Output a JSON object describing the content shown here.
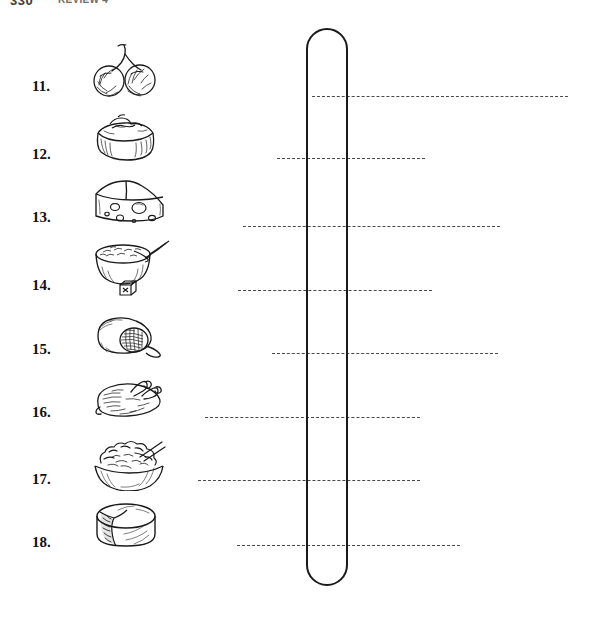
{
  "page": {
    "width": 591,
    "height": 619,
    "background": "#ffffff",
    "ink_color": "#1a1a1a",
    "line_color": "#4a4a4a"
  },
  "header": {
    "page_number": "330",
    "section_label": "REVIEW 4",
    "visible": "partially cut off at top edge"
  },
  "capsule": {
    "name": "answer-column-capsule",
    "shape": "vertical rounded rectangle outline",
    "x": 306,
    "y": 28,
    "width": 42,
    "height": 558,
    "stroke": "#1a1a1a"
  },
  "items": [
    {
      "number": "11.",
      "icon": "cherries-icon",
      "label": "cherries",
      "num_y": 85,
      "pic": {
        "x": 88,
        "y": 42,
        "w": 72,
        "h": 62
      },
      "line": {
        "x": 312,
        "y": 96,
        "width": 256
      }
    },
    {
      "number": "12.",
      "icon": "cake-slice-icon",
      "label": "layered cake",
      "num_y": 153,
      "pic": {
        "x": 90,
        "y": 113,
        "w": 70,
        "h": 52
      },
      "line": {
        "x": 277,
        "y": 158,
        "width": 148
      }
    },
    {
      "number": "13.",
      "icon": "swiss-cheese-wedge-icon",
      "label": "cheese wedge",
      "num_y": 216,
      "pic": {
        "x": 90,
        "y": 178,
        "w": 78,
        "h": 52
      },
      "line": {
        "x": 243,
        "y": 226,
        "width": 257
      }
    },
    {
      "number": "14.",
      "icon": "cereal-bowl-icon",
      "label": "bowl of cereal with spoon",
      "num_y": 284,
      "pic": {
        "x": 90,
        "y": 239,
        "w": 82,
        "h": 58
      },
      "line": {
        "x": 238,
        "y": 290,
        "width": 194
      }
    },
    {
      "number": "15.",
      "icon": "ham-slice-icon",
      "label": "ham",
      "num_y": 348,
      "pic": {
        "x": 90,
        "y": 310,
        "w": 78,
        "h": 52
      },
      "line": {
        "x": 272,
        "y": 353,
        "width": 226
      }
    },
    {
      "number": "16.",
      "icon": "roast-chicken-icon",
      "label": "roast chicken",
      "num_y": 411,
      "pic": {
        "x": 90,
        "y": 374,
        "w": 78,
        "h": 52
      },
      "line": {
        "x": 205,
        "y": 417,
        "width": 215
      }
    },
    {
      "number": "17.",
      "icon": "salad-bowl-icon",
      "label": "salad bowl",
      "num_y": 478,
      "pic": {
        "x": 88,
        "y": 435,
        "w": 82,
        "h": 56
      },
      "line": {
        "x": 198,
        "y": 480,
        "width": 222
      }
    },
    {
      "number": "18.",
      "icon": "cheese-wheel-icon",
      "label": "cheese wheel",
      "num_y": 541,
      "pic": {
        "x": 90,
        "y": 500,
        "w": 76,
        "h": 54
      },
      "line": {
        "x": 237,
        "y": 545,
        "width": 223
      }
    }
  ]
}
